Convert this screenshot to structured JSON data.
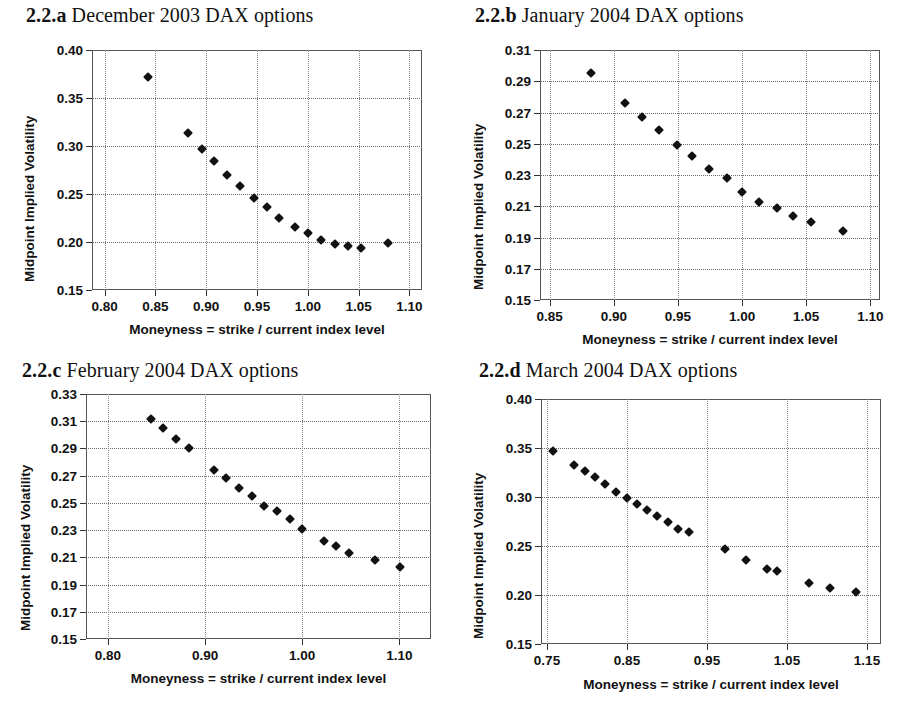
{
  "figure": {
    "axis_x_title": "Moneyness = strike / current index level",
    "axis_y_title": "Midpoint Implied Volatility"
  },
  "panels": [
    {
      "id": "a",
      "number": "2.2.a",
      "title": "December 2003 DAX options",
      "xticks": [
        "0.80",
        "0.85",
        "0.90",
        "0.95",
        "1.00",
        "1.05",
        "1.10"
      ],
      "yticks": [
        "0.15",
        "0.20",
        "0.25",
        "0.30",
        "0.35",
        "0.40"
      ]
    },
    {
      "id": "b",
      "number": "2.2.b",
      "title": "January 2004 DAX options",
      "xticks": [
        "0.85",
        "0.90",
        "0.95",
        "1.00",
        "1.05",
        "1.10"
      ],
      "yticks": [
        "0.15",
        "0.17",
        "0.19",
        "0.21",
        "0.23",
        "0.25",
        "0.27",
        "0.29",
        "0.31"
      ]
    },
    {
      "id": "c",
      "number": "2.2.c",
      "title": "February 2004 DAX options",
      "xticks": [
        "0.80",
        "0.90",
        "1.00",
        "1.10"
      ],
      "yticks": [
        "0.15",
        "0.17",
        "0.19",
        "0.21",
        "0.23",
        "0.25",
        "0.27",
        "0.29",
        "0.31",
        "0.33"
      ]
    },
    {
      "id": "d",
      "number": "2.2.d",
      "title": "March 2004 DAX options",
      "xticks": [
        "0.75",
        "0.85",
        "0.95",
        "1.05",
        "1.15"
      ],
      "yticks": [
        "0.15",
        "0.20",
        "0.25",
        "0.30",
        "0.35",
        "0.40"
      ]
    }
  ],
  "chart_data": [
    {
      "type": "scatter",
      "panel": "2.2.a",
      "title": "December 2003 DAX options",
      "xlabel": "Moneyness = strike / current index level",
      "ylabel": "Midpoint Implied Volatility",
      "xlim": [
        0.7875,
        1.1125
      ],
      "ylim": [
        0.15,
        0.4
      ],
      "xticks": [
        0.8,
        0.85,
        0.9,
        0.95,
        1.0,
        1.05,
        1.1
      ],
      "yticks": [
        0.15,
        0.2,
        0.25,
        0.3,
        0.35,
        0.4
      ],
      "grid": true,
      "legend": "none",
      "marker": "filled-diamond",
      "x": [
        0.843,
        0.882,
        0.896,
        0.908,
        0.92,
        0.933,
        0.947,
        0.96,
        0.972,
        0.987,
        1.0,
        1.013,
        1.027,
        1.04,
        1.052,
        1.079
      ],
      "y": [
        0.372,
        0.314,
        0.297,
        0.284,
        0.27,
        0.258,
        0.246,
        0.236,
        0.225,
        0.216,
        0.209,
        0.202,
        0.198,
        0.196,
        0.194,
        0.199
      ]
    },
    {
      "type": "scatter",
      "panel": "2.2.b",
      "title": "January 2004 DAX options",
      "xlabel": "Moneyness = strike / current index level",
      "ylabel": "Midpoint Implied Volatility",
      "xlim": [
        0.8425,
        1.1075
      ],
      "ylim": [
        0.15,
        0.31
      ],
      "xticks": [
        0.85,
        0.9,
        0.95,
        1.0,
        1.05,
        1.1
      ],
      "yticks": [
        0.15,
        0.17,
        0.19,
        0.21,
        0.23,
        0.25,
        0.27,
        0.29,
        0.31
      ],
      "grid": true,
      "legend": "none",
      "marker": "filled-diamond",
      "x": [
        0.882,
        0.909,
        0.922,
        0.935,
        0.949,
        0.961,
        0.974,
        0.988,
        1.0,
        1.013,
        1.027,
        1.04,
        1.054,
        1.079
      ],
      "y": [
        0.295,
        0.276,
        0.267,
        0.259,
        0.249,
        0.242,
        0.234,
        0.228,
        0.219,
        0.213,
        0.209,
        0.204,
        0.2,
        0.194
      ]
    },
    {
      "type": "scatter",
      "panel": "2.2.c",
      "title": "February 2004 DAX options",
      "xlabel": "Moneyness = strike / current index level",
      "ylabel": "Midpoint Implied Volatility",
      "xlim": [
        0.7775,
        1.1325
      ],
      "ylim": [
        0.15,
        0.33
      ],
      "xticks": [
        0.8,
        0.9,
        1.0,
        1.1
      ],
      "yticks": [
        0.15,
        0.17,
        0.19,
        0.21,
        0.23,
        0.25,
        0.27,
        0.29,
        0.31,
        0.33
      ],
      "grid": true,
      "legend": "none",
      "marker": "filled-diamond",
      "x": [
        0.844,
        0.857,
        0.87,
        0.883,
        0.909,
        0.922,
        0.935,
        0.948,
        0.961,
        0.974,
        0.987,
        1.0,
        1.022,
        1.035,
        1.048,
        1.075,
        1.101
      ],
      "y": [
        0.312,
        0.305,
        0.297,
        0.29,
        0.274,
        0.268,
        0.261,
        0.255,
        0.248,
        0.244,
        0.238,
        0.231,
        0.222,
        0.218,
        0.213,
        0.208,
        0.203
      ]
    },
    {
      "type": "scatter",
      "panel": "2.2.d",
      "title": "March 2004 DAX options",
      "xlabel": "Moneyness = strike / current index level",
      "ylabel": "Midpoint Implied Volatility",
      "xlim": [
        0.7425,
        1.1675
      ],
      "ylim": [
        0.15,
        0.4
      ],
      "xticks": [
        0.75,
        0.85,
        0.95,
        1.05,
        1.15
      ],
      "yticks": [
        0.15,
        0.2,
        0.25,
        0.3,
        0.35,
        0.4
      ],
      "grid": true,
      "legend": "none",
      "marker": "filled-diamond",
      "x": [
        0.758,
        0.784,
        0.797,
        0.81,
        0.823,
        0.836,
        0.85,
        0.862,
        0.875,
        0.888,
        0.901,
        0.914,
        0.928,
        0.972,
        0.999,
        1.025,
        1.038,
        1.077,
        1.104,
        1.136
      ],
      "y": [
        0.347,
        0.333,
        0.327,
        0.32,
        0.313,
        0.305,
        0.299,
        0.293,
        0.287,
        0.281,
        0.274,
        0.267,
        0.264,
        0.247,
        0.236,
        0.227,
        0.224,
        0.212,
        0.207,
        0.203
      ]
    }
  ]
}
